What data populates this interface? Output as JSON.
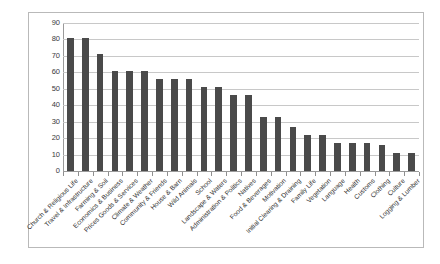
{
  "chart_data": {
    "type": "bar",
    "title": "",
    "subtitle": "",
    "xlabel": "",
    "ylabel": "",
    "ylim": [
      0,
      90
    ],
    "ytick_step": 10,
    "yticks": [
      0,
      10,
      20,
      30,
      40,
      50,
      60,
      70,
      80,
      90
    ],
    "grid": true,
    "legend": "none",
    "bar_color": "#4a4a4a",
    "gridline_color": "#c8c8c8",
    "axis_color": "#9a9a9a",
    "frame_color": "#b9b9b9",
    "categories": [
      "Church & Religious Life",
      "Travel & Infrastructure",
      "Farming & Soil",
      "Economics & Business",
      "Prices Goods & Services",
      "Climate & Weather",
      "Community & Friends",
      "House & Barn",
      "Wild Animals",
      "School",
      "Landscape & Waters",
      "Administration & Politics",
      "Natives",
      "Food & Beverages",
      "Motivation",
      "Initial Clearing & Draining",
      "Family Life",
      "Vegetation",
      "Language",
      "Health",
      "Customs",
      "Clothing",
      "Culture",
      "Logging & Lumber"
    ],
    "values": [
      81,
      81,
      71,
      61,
      61,
      61,
      56,
      56,
      56,
      51,
      51,
      46,
      46,
      33,
      33,
      27,
      22,
      22,
      17,
      17,
      17,
      16,
      11,
      11
    ]
  }
}
